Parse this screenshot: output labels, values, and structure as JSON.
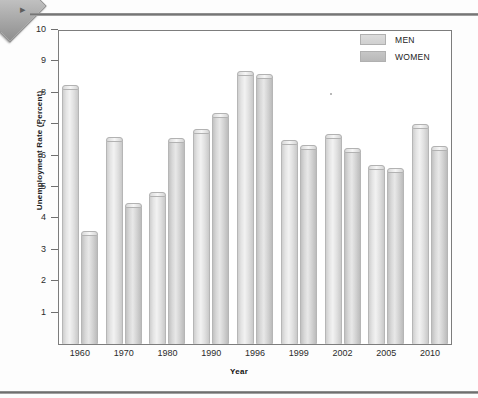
{
  "page": {
    "corner_badge_icon": "diamond-badge-icon",
    "corner_glyph": "▸"
  },
  "legend": {
    "position": "top-right",
    "items": [
      {
        "label": "MEN",
        "color": "#dcdcdc",
        "key": "men"
      },
      {
        "label": "WOMEN",
        "color": "#c6c6c6",
        "key": "women"
      }
    ]
  },
  "axes": {
    "y_title": "Unemployment Rate (Percent)",
    "x_title": "Year",
    "y_ticks": [
      "10",
      "9",
      "8",
      "7",
      "6",
      "5",
      "4",
      "3",
      "2",
      "1"
    ],
    "x_ticks": [
      "1960",
      "1970",
      "1980",
      "1990",
      "1996",
      "1999",
      "2002",
      "2005",
      "2010"
    ]
  },
  "chart_data": {
    "type": "bar",
    "title": "",
    "subtitle": "",
    "xlabel": "Year",
    "ylabel": "Unemployment Rate (Percent)",
    "ylim": [
      0,
      10
    ],
    "ytick_values": [
      1,
      2,
      3,
      4,
      5,
      6,
      7,
      8,
      9,
      10
    ],
    "grid": false,
    "legend_position": "top-right",
    "categories": [
      "1960",
      "1970",
      "1980",
      "1990",
      "1996",
      "1999",
      "2002",
      "2005",
      "2010"
    ],
    "series": [
      {
        "name": "MEN",
        "color": "#dcdcdc",
        "values": [
          8.25,
          6.6,
          4.85,
          6.85,
          8.7,
          6.5,
          6.7,
          5.7,
          7.0
        ]
      },
      {
        "name": "WOMEN",
        "color": "#c6c6c6",
        "values": [
          3.6,
          4.5,
          6.55,
          7.35,
          8.6,
          6.35,
          6.25,
          5.6,
          6.3
        ]
      }
    ]
  }
}
